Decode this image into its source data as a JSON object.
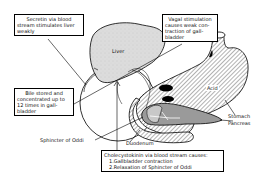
{
  "diagram": {
    "organs": {
      "liver": "Liver",
      "acid": "Acid",
      "stomach": "Stomach",
      "pancreas": "Pancreas",
      "duodenum": "Duodenum",
      "sphincter": "Sphincter of Oddi"
    },
    "callouts": {
      "secretin": {
        "lines": [
          "Secretin via blood",
          "stream stimulates liver",
          "weakly"
        ]
      },
      "vagal": {
        "lines": [
          "Vagal stimulation",
          "causes weak con-",
          "traction of gall-",
          "bladder"
        ]
      },
      "bile": {
        "lines": [
          "Bile stored and",
          "concentrated up to",
          "12 times in gall-",
          "bladder"
        ]
      },
      "cck": {
        "lines": [
          "Cholecystokinin via blood stream causes:",
          "1.Gallbladder contraction",
          "2.Relaxation of Sphincter of Oddi"
        ]
      }
    },
    "colors": {
      "liver_fill": "#d9d9d9",
      "pancreas_fill": "#9a9a9a",
      "outline": "#000000",
      "hatch": "#555555"
    }
  }
}
